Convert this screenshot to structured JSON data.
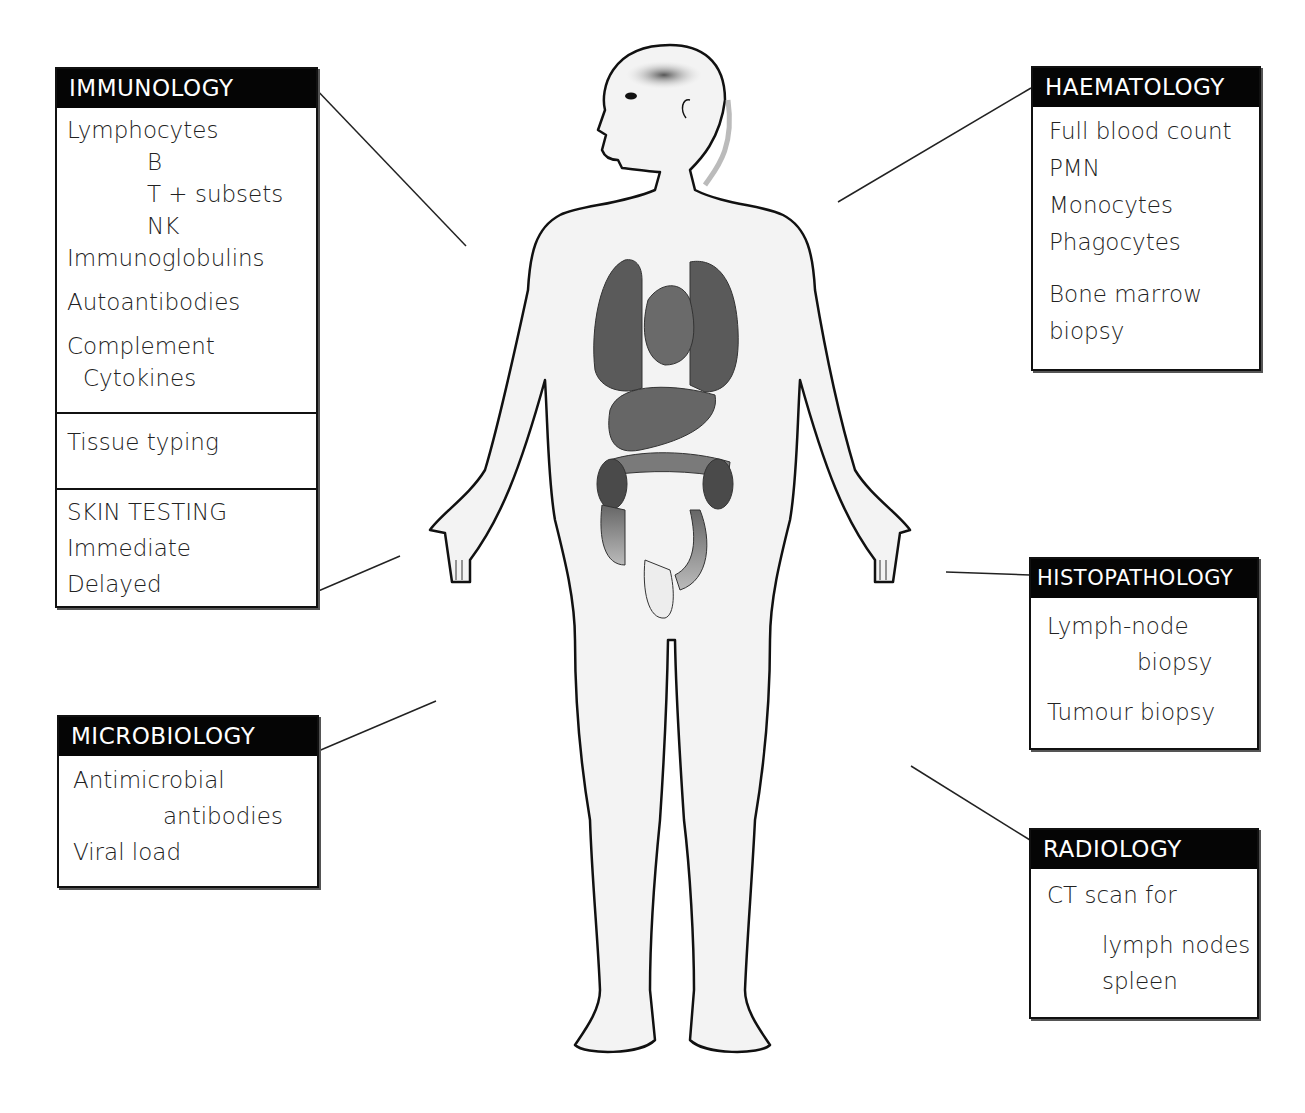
{
  "boxes": {
    "immunology": {
      "header": "IMMUNOLOGY",
      "sections": [
        {
          "lines": [
            {
              "text": "Lymphocytes",
              "indent": 0
            },
            {
              "text": "B",
              "indent": 80
            },
            {
              "text": "T + subsets",
              "indent": 80
            },
            {
              "text": "NK",
              "indent": 80
            },
            {
              "text": "Immunoglobulins",
              "indent": 0
            },
            {
              "text": "Autoantibodies",
              "indent": 0
            },
            {
              "text": "Complement",
              "indent": 0
            },
            {
              "text": "Cytokines",
              "indent": 16
            }
          ]
        },
        {
          "lines": [
            {
              "text": "Tissue typing",
              "indent": 0
            }
          ]
        },
        {
          "lines": [
            {
              "text": "SKIN TESTING",
              "indent": 0
            },
            {
              "text": "Immediate",
              "indent": 0
            },
            {
              "text": "Delayed",
              "indent": 0
            }
          ]
        }
      ]
    },
    "microbiology": {
      "header": "MICROBIOLOGY",
      "lines": [
        {
          "text": "Antimicrobial",
          "indent": 0
        },
        {
          "text": "antibodies",
          "indent": 90
        },
        {
          "text": "Viral load",
          "indent": 0
        }
      ]
    },
    "haematology": {
      "header": "HAEMATOLOGY",
      "lines": [
        {
          "text": "Full blood count",
          "indent": 0
        },
        {
          "text": "PMN",
          "indent": 0
        },
        {
          "text": "Monocytes",
          "indent": 0
        },
        {
          "text": "Phagocytes",
          "indent": 0
        },
        {
          "text": "Bone marrow",
          "indent": 0
        },
        {
          "text": "biopsy",
          "indent": 0
        }
      ]
    },
    "histopathology": {
      "header": "HISTOPATHOLOGY",
      "lines": [
        {
          "text": "Lymph-node",
          "indent": 0
        },
        {
          "text": "biopsy",
          "indent": 90
        },
        {
          "text": "Tumour biopsy",
          "indent": 0
        }
      ]
    },
    "radiology": {
      "header": "RADIOLOGY",
      "lines": [
        {
          "text": "CT scan for",
          "indent": 0
        },
        {
          "text": "lymph nodes",
          "indent": 55
        },
        {
          "text": "spleen",
          "indent": 55
        }
      ]
    }
  },
  "colors": {
    "header_bg": "#050505",
    "header_text": "#ffffff",
    "body_fill": "#f2f2f2",
    "organ_dark": "#555555",
    "organ_mid": "#777777"
  }
}
